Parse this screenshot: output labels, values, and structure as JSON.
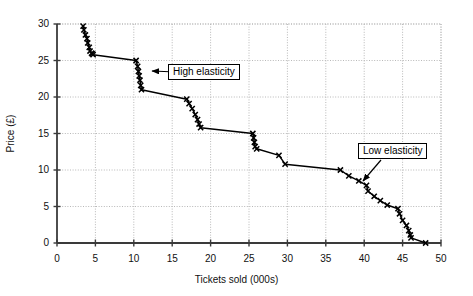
{
  "chart_data": {
    "type": "line",
    "title": "",
    "subtitle": "",
    "xlabel": "Tickets sold (000s)",
    "ylabel": "Price (£)",
    "xlim": [
      0,
      50
    ],
    "ylim": [
      0,
      30
    ],
    "xticks": [
      0,
      5,
      10,
      15,
      20,
      25,
      30,
      35,
      40,
      45,
      50
    ],
    "yticks": [
      0,
      5,
      10,
      15,
      20,
      25,
      30
    ],
    "grid": true,
    "legend": null,
    "marker": "x-cross",
    "line_color": "#000000",
    "grid_color": "#b8b8b8",
    "axis_color": "#3a3a3a",
    "series": [
      {
        "name": "Demand curve",
        "x": [
          3.4,
          3.5,
          3.7,
          3.9,
          4.0,
          4.2,
          4.3,
          4.5,
          4.6,
          4.7,
          10.3,
          10.5,
          10.6,
          10.7,
          10.8,
          10.9,
          11.0,
          16.9,
          17.2,
          17.6,
          18.0,
          18.3,
          18.5,
          18.7,
          25.5,
          25.6,
          25.7,
          25.8,
          26.0,
          28.9,
          29.7,
          36.9,
          38.0,
          39.3,
          40.3,
          40.5,
          41.3,
          42.1,
          43.0,
          44.4,
          44.6,
          45.0,
          45.5,
          45.8,
          46.0,
          46.1,
          48.0
        ],
        "y": [
          29.7,
          29.2,
          28.5,
          28.0,
          27.4,
          26.8,
          26.3,
          26.0,
          25.9,
          25.8,
          25.0,
          24.2,
          23.5,
          22.9,
          22.3,
          21.6,
          21.0,
          19.7,
          19.1,
          18.4,
          17.6,
          16.9,
          16.3,
          15.8,
          15.0,
          14.4,
          13.8,
          13.2,
          12.9,
          12.0,
          10.8,
          10.0,
          9.2,
          8.5,
          7.9,
          7.1,
          6.4,
          5.8,
          5.2,
          4.7,
          4.0,
          3.1,
          2.4,
          1.7,
          1.1,
          0.7,
          0.0
        ]
      }
    ],
    "annotations": [
      {
        "name": "high-elasticity",
        "text": "High elasticity",
        "box_x": 168,
        "box_y": 64,
        "arrow_from_x": 200,
        "arrow_from_y": 73,
        "arrow_to_x": 152,
        "arrow_to_y": 71
      },
      {
        "name": "low-elasticity",
        "text": "Low elasticity",
        "box_x": 358,
        "box_y": 143,
        "arrow_from_x": 381,
        "arrow_from_y": 160,
        "arrow_to_x": 363,
        "arrow_to_y": 181
      }
    ]
  },
  "axes": {
    "y_title": "Price (£)",
    "x_title": "Tickets sold (000s)",
    "y_tick_labels": [
      "30",
      "25",
      "20",
      "15",
      "10",
      "5",
      "0"
    ],
    "x_tick_labels": [
      "0",
      "5",
      "10",
      "15",
      "20",
      "25",
      "30",
      "35",
      "40",
      "45",
      "50"
    ]
  },
  "annotations": {
    "high": "High elasticity",
    "low": "Low elasticity"
  }
}
